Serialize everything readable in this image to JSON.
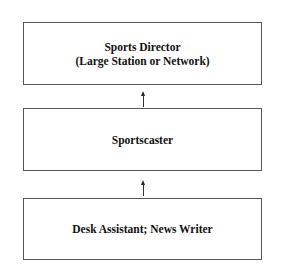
{
  "diagram": {
    "type": "career-ladder",
    "boxes": [
      {
        "lines": [
          "Sports Director",
          "(Large Station or Network)"
        ]
      },
      {
        "lines": [
          "Sportscaster"
        ]
      },
      {
        "lines": [
          "Desk Assistant; News Writer"
        ]
      }
    ],
    "arrows": [
      {
        "from": "Sportscaster",
        "to": "Sports Director",
        "direction": "up"
      },
      {
        "from": "Desk Assistant; News Writer",
        "to": "Sportscaster",
        "direction": "up"
      }
    ]
  }
}
